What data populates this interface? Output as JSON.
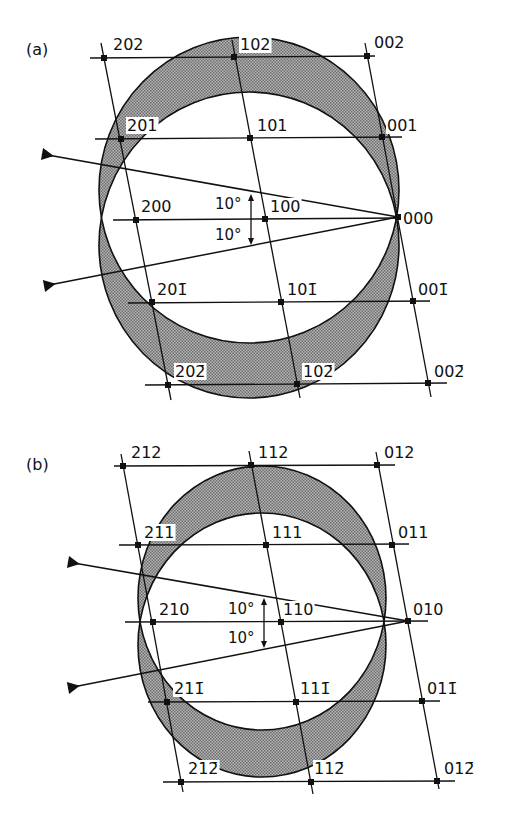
{
  "figure": {
    "title": "",
    "colors": {
      "ink": "#111111",
      "shade": "#8c8c8c",
      "background": "#ffffff"
    },
    "panels": [
      {
        "id": "a",
        "label": "(a)",
        "label_pos": [
          26,
          55
        ],
        "origin_label": "000",
        "sphere": {
          "cx": 249,
          "cy_upper": 190,
          "cy_lower": 245,
          "rx": 150,
          "ry": 153
        },
        "beams": [
          {
            "from": [
              42,
              154
            ],
            "to": [
              398,
              217
            ],
            "tip": [
              398,
              217
            ]
          },
          {
            "from": [
              44,
              286
            ],
            "to": [
              398,
              217
            ],
            "tip": [
              398,
              217
            ]
          }
        ],
        "angle_arc": {
          "x": 251,
          "y_top": 194,
          "y_bottom": 245
        },
        "angle_labels": [
          {
            "text": "10°",
            "pos": [
              215,
              209
            ]
          },
          {
            "text": "10°",
            "pos": [
              215,
              240
            ]
          }
        ],
        "rows": [
          {
            "y_left": 58,
            "y_right": 56,
            "x1": 90,
            "x2": 375
          },
          {
            "y_left": 139,
            "y_right": 137,
            "x1": 95,
            "x2": 402
          },
          {
            "y_left": 220,
            "y_right": 218,
            "x1": 113,
            "x2": 400
          },
          {
            "y_left": 303,
            "y_right": 301,
            "x1": 128,
            "x2": 430
          },
          {
            "y_left": 385,
            "y_right": 383,
            "x1": 145,
            "x2": 447
          }
        ],
        "columns": [
          {
            "x1": 101,
            "y1": 43,
            "x2": 171,
            "y2": 400
          },
          {
            "x1": 232,
            "y1": 40,
            "x2": 300,
            "y2": 398
          },
          {
            "x1": 365,
            "y1": 43,
            "x2": 431,
            "y2": 397
          }
        ],
        "points": [
          {
            "hkl": "202",
            "x": 104,
            "y": 58,
            "lx": 113,
            "ly": 50
          },
          {
            "hkl": "102",
            "x": 234,
            "y": 57,
            "lx": 240,
            "ly": 50
          },
          {
            "hkl": "002",
            "x": 367,
            "y": 56,
            "lx": 374,
            "ly": 48
          },
          {
            "hkl": "201",
            "x": 121,
            "y": 139,
            "lx": 127,
            "ly": 131
          },
          {
            "hkl": "101",
            "x": 250,
            "y": 138,
            "lx": 257,
            "ly": 131
          },
          {
            "hkl": "001",
            "x": 382,
            "y": 137,
            "lx": 387,
            "ly": 131
          },
          {
            "hkl": "200",
            "x": 136,
            "y": 220,
            "lx": 141,
            "ly": 212
          },
          {
            "hkl": "100",
            "x": 265,
            "y": 219,
            "lx": 270,
            "ly": 212
          },
          {
            "hkl": "000",
            "x": 398,
            "y": 217,
            "lx": 403,
            "ly": 224
          },
          {
            "hkl": "201̄",
            "x": 152,
            "y": 302,
            "lx": 157,
            "ly": 295
          },
          {
            "hkl": "101̄",
            "x": 281,
            "y": 302,
            "lx": 287,
            "ly": 295
          },
          {
            "hkl": "001̄",
            "x": 413,
            "y": 301,
            "lx": 418,
            "ly": 295
          },
          {
            "hkl": "202̄",
            "x": 168,
            "y": 385,
            "lx": 175,
            "ly": 377
          },
          {
            "hkl": "102̄",
            "x": 297,
            "y": 384,
            "lx": 303,
            "ly": 377
          },
          {
            "hkl": "002̄",
            "x": 428,
            "y": 383,
            "lx": 434,
            "ly": 377
          }
        ]
      },
      {
        "id": "b",
        "label": "(b)",
        "label_pos": [
          26,
          470
        ],
        "origin_label": "010",
        "sphere": {
          "cx": 262,
          "cy_upper": 598,
          "cy_lower": 645,
          "rx": 124,
          "ry": 132
        },
        "beams": [
          {
            "from": [
              68,
              562
            ],
            "to": [
              408,
              621
            ],
            "tip": [
              408,
              621
            ]
          },
          {
            "from": [
              68,
              688
            ],
            "to": [
              408,
              621
            ],
            "tip": [
              408,
              621
            ]
          }
        ],
        "angle_arc": {
          "x": 264,
          "y_top": 598,
          "y_bottom": 648
        },
        "angle_labels": [
          {
            "text": "10°",
            "pos": [
              228,
              614
            ]
          },
          {
            "text": "10°",
            "pos": [
              228,
              643
            ]
          }
        ],
        "rows": [
          {
            "y_left": 466,
            "y_right": 465,
            "x1": 114,
            "x2": 395
          },
          {
            "y_left": 545,
            "y_right": 544,
            "x1": 119,
            "x2": 409
          },
          {
            "y_left": 622,
            "y_right": 621,
            "x1": 125,
            "x2": 428
          },
          {
            "y_left": 702,
            "y_right": 701,
            "x1": 148,
            "x2": 440
          },
          {
            "y_left": 782,
            "y_right": 781,
            "x1": 163,
            "x2": 455
          }
        ],
        "columns": [
          {
            "x1": 121,
            "y1": 454,
            "x2": 183,
            "y2": 792
          },
          {
            "x1": 249,
            "y1": 451,
            "x2": 313,
            "y2": 794
          },
          {
            "x1": 376,
            "y1": 452,
            "x2": 439,
            "y2": 789
          }
        ],
        "points": [
          {
            "hkl": "212",
            "x": 123,
            "y": 466,
            "lx": 131,
            "ly": 458
          },
          {
            "hkl": "112",
            "x": 251,
            "y": 465,
            "lx": 258,
            "ly": 458
          },
          {
            "hkl": "012",
            "x": 377,
            "y": 465,
            "lx": 384,
            "ly": 458
          },
          {
            "hkl": "211",
            "x": 138,
            "y": 545,
            "lx": 144,
            "ly": 538
          },
          {
            "hkl": "111",
            "x": 266,
            "y": 545,
            "lx": 272,
            "ly": 538
          },
          {
            "hkl": "011",
            "x": 392,
            "y": 545,
            "lx": 398,
            "ly": 538
          },
          {
            "hkl": "210",
            "x": 153,
            "y": 622,
            "lx": 159,
            "ly": 615
          },
          {
            "hkl": "110",
            "x": 281,
            "y": 622,
            "lx": 283,
            "ly": 615
          },
          {
            "hkl": "010",
            "x": 408,
            "y": 621,
            "lx": 413,
            "ly": 615
          },
          {
            "hkl": "211̄",
            "x": 167,
            "y": 702,
            "lx": 174,
            "ly": 694
          },
          {
            "hkl": "111̄",
            "x": 296,
            "y": 702,
            "lx": 300,
            "ly": 694
          },
          {
            "hkl": "011̄",
            "x": 422,
            "y": 701,
            "lx": 427,
            "ly": 694
          },
          {
            "hkl": "212̄",
            "x": 181,
            "y": 782,
            "lx": 188,
            "ly": 774
          },
          {
            "hkl": "112̄",
            "x": 311,
            "y": 782,
            "lx": 314,
            "ly": 774
          },
          {
            "hkl": "012̄",
            "x": 437,
            "y": 781,
            "lx": 444,
            "ly": 774
          }
        ]
      }
    ]
  }
}
